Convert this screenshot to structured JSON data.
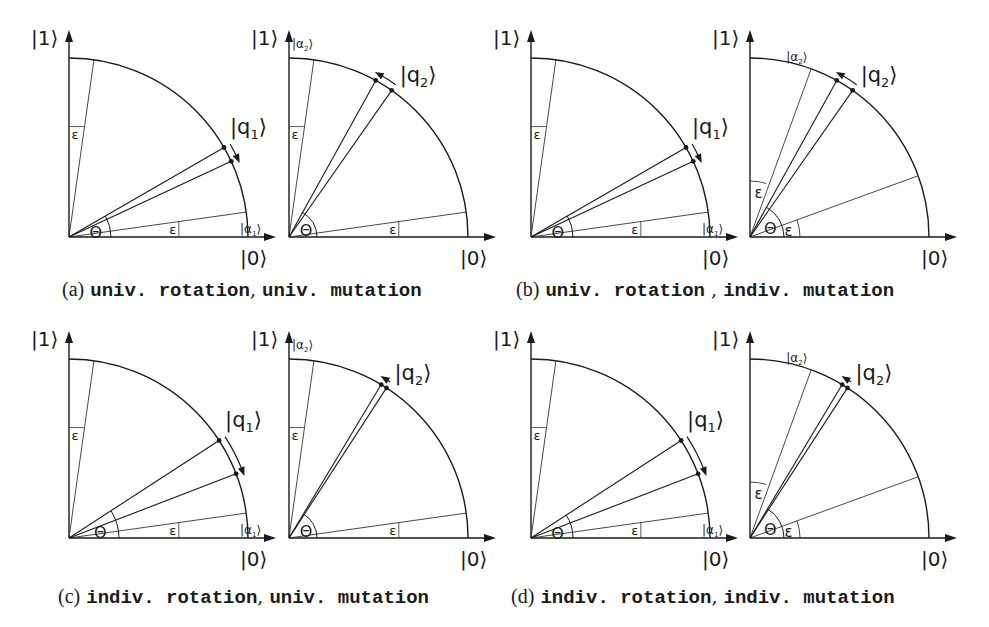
{
  "figure": {
    "colors": {
      "ink": "#1a1a1a",
      "thin": "#333333",
      "background": "#ffffff"
    },
    "labels": {
      "ket0": "|0⟩",
      "ket1": "|1⟩",
      "q1": "|q",
      "q1_sub": "1",
      "q2": "|q",
      "q2_sub": "2",
      "a1": "|α",
      "a1_sub": "1",
      "a2": "|α",
      "a2_sub": "2",
      "theta": "Θ",
      "epsilon": "ε",
      "ket_close": "⟩"
    },
    "subfigures": [
      {
        "id": "a",
        "tag": "(a)",
        "caption_part1": "univ. rotation",
        "sep": ", ",
        "caption_part2": "univ. mutation"
      },
      {
        "id": "b",
        "tag": "(b)",
        "caption_part1": "univ. rotation",
        "sep": " , ",
        "caption_part2": "indiv. mutation"
      },
      {
        "id": "c",
        "tag": "(c)",
        "caption_part1": "indiv. rotation",
        "sep": ", ",
        "caption_part2": "univ. mutation"
      },
      {
        "id": "d",
        "tag": "(d)",
        "caption_part1": "indiv. rotation",
        "sep": ", ",
        "caption_part2": "indiv. mutation"
      }
    ]
  }
}
